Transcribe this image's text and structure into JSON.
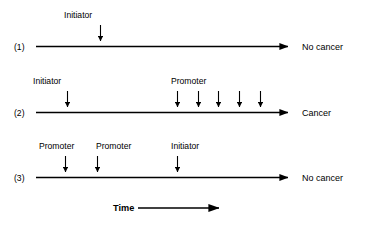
{
  "figure": {
    "title_visible": false,
    "background_color": "#ffffff",
    "ink_color": "#000000",
    "time_axis": {
      "label": "Time",
      "arrow_direction": "right"
    },
    "rows": [
      {
        "row_label": "(1)",
        "outcome": "No cancer",
        "events": [
          {
            "label": "Initiator",
            "type": "initiator",
            "order": 1
          }
        ]
      },
      {
        "row_label": "(2)",
        "outcome": "Cancer",
        "events": [
          {
            "label": "Initiator",
            "type": "initiator",
            "order": 1
          },
          {
            "label": "Promoter",
            "type": "promoter",
            "order": 2
          },
          {
            "label": "",
            "type": "promoter",
            "order": 3
          },
          {
            "label": "",
            "type": "promoter",
            "order": 4
          },
          {
            "label": "",
            "type": "promoter",
            "order": 5
          },
          {
            "label": "",
            "type": "promoter",
            "order": 6
          }
        ]
      },
      {
        "row_label": "(3)",
        "outcome": "No cancer",
        "events": [
          {
            "label": "Promoter",
            "type": "promoter",
            "order": 1
          },
          {
            "label": "Promoter",
            "type": "promoter",
            "order": 2
          },
          {
            "label": "Initiator",
            "type": "initiator",
            "order": 3
          }
        ]
      }
    ]
  },
  "labels": {
    "row1_number": "(1)",
    "row1_initiator": "Initiator",
    "row1_outcome": "No cancer",
    "row2_number": "(2)",
    "row2_initiator": "Initiator",
    "row2_promoter": "Promoter",
    "row2_outcome": "Cancer",
    "row3_number": "(3)",
    "row3_promoter_a": "Promoter",
    "row3_promoter_b": "Promoter",
    "row3_initiator": "Initiator",
    "row3_outcome": "No cancer",
    "time": "Time"
  }
}
